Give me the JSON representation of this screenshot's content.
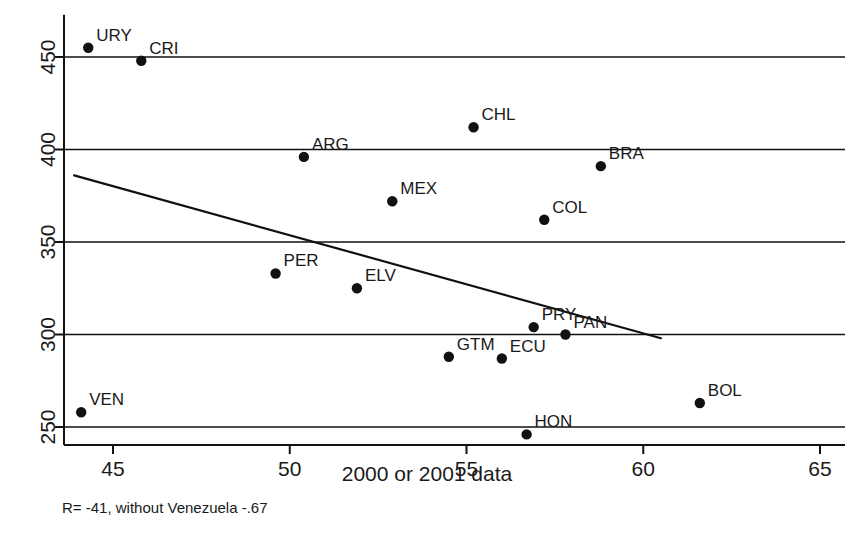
{
  "chart_data": {
    "type": "scatter",
    "title": "",
    "xlabel": "2000 or 2001 data",
    "ylabel": "",
    "xlim": [
      43.1,
      65.6
    ],
    "ylim": [
      241,
      462
    ],
    "xticks": [
      45,
      50,
      55,
      60,
      65
    ],
    "yticks": [
      250,
      300,
      350,
      400,
      450
    ],
    "xtick_labels": [
      "45",
      "50",
      "55",
      "60",
      "65"
    ],
    "ytick_labels": [
      "250",
      "300",
      "350",
      "400",
      "450"
    ],
    "grid": "horizontal",
    "legend": "none",
    "annotation": "R= -41, without Venezuela -.67",
    "points": [
      {
        "label": "URY",
        "x": 44.3,
        "y": 455,
        "label_dx": 8,
        "label_dy": -7
      },
      {
        "label": "CRI",
        "x": 45.8,
        "y": 448,
        "label_dx": 8,
        "label_dy": -7
      },
      {
        "label": "CHL",
        "x": 55.2,
        "y": 412,
        "label_dx": 8,
        "label_dy": -7
      },
      {
        "label": "ARG",
        "x": 50.4,
        "y": 396,
        "label_dx": 8,
        "label_dy": -7
      },
      {
        "label": "BRA",
        "x": 58.8,
        "y": 391,
        "label_dx": 8,
        "label_dy": -7
      },
      {
        "label": "MEX",
        "x": 52.9,
        "y": 372,
        "label_dx": 8,
        "label_dy": -7
      },
      {
        "label": "COL",
        "x": 57.2,
        "y": 362,
        "label_dx": 8,
        "label_dy": -7
      },
      {
        "label": "PER",
        "x": 49.6,
        "y": 333,
        "label_dx": 8,
        "label_dy": -7
      },
      {
        "label": "ELV",
        "x": 51.9,
        "y": 325,
        "label_dx": 8,
        "label_dy": -7
      },
      {
        "label": "PRY",
        "x": 56.9,
        "y": 304,
        "label_dx": 8,
        "label_dy": -7
      },
      {
        "label": "PAN",
        "x": 57.8,
        "y": 300,
        "label_dx": 8,
        "label_dy": -7
      },
      {
        "label": "GTM",
        "x": 54.5,
        "y": 288,
        "label_dx": 8,
        "label_dy": -7
      },
      {
        "label": "ECU",
        "x": 56.0,
        "y": 287,
        "label_dx": 8,
        "label_dy": -7
      },
      {
        "label": "BOL",
        "x": 61.6,
        "y": 263,
        "label_dx": 8,
        "label_dy": -7
      },
      {
        "label": "VEN",
        "x": 44.1,
        "y": 258,
        "label_dx": 8,
        "label_dy": -7
      },
      {
        "label": "HON",
        "x": 56.7,
        "y": 246,
        "label_dx": 8,
        "label_dy": -7
      }
    ],
    "trendline": {
      "x0": 43.9,
      "y0": 386,
      "x1": 60.5,
      "y1": 298
    }
  }
}
